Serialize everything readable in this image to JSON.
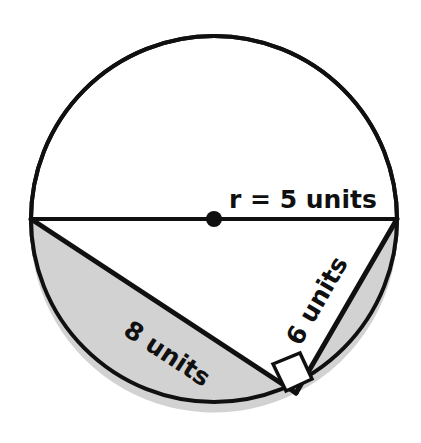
{
  "figure": {
    "type": "geometry-diagram",
    "shape": "circle-with-inscribed-right-triangle",
    "background_color": "#ffffff",
    "stroke_color": "#101010",
    "shaded_fill_color": "#d2d2d2",
    "circle": {
      "center_x": 214,
      "center_y": 219,
      "radius_px": 183,
      "radius_label": "r = 5 units",
      "center_dot_radius_px": 8
    },
    "diameter": {
      "label": "r = 5 units",
      "left_x": 31,
      "left_y": 219,
      "right_x": 397,
      "right_y": 219
    },
    "triangle": {
      "vertex_left_x": 31,
      "vertex_left_y": 219,
      "vertex_right_x": 397,
      "vertex_right_y": 219,
      "vertex_bottom_x": 296,
      "vertex_bottom_y": 393,
      "hypotenuse_label": "r = 5 units",
      "long_leg_label": "8 units",
      "short_leg_label": "6 units",
      "right_angle_marker": "right-angle-square"
    },
    "labels": {
      "radius": "r = 5 units",
      "long_leg": "8 units",
      "short_leg": "6 units"
    },
    "shaded_regions": [
      {
        "name": "left-segment",
        "description": "circular segment below the 8 units chord"
      },
      {
        "name": "right-segment",
        "description": "circular segment right of the 6 units chord"
      }
    ]
  }
}
